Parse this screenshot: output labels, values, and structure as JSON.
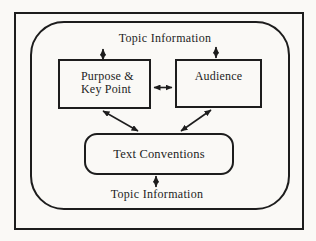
{
  "diagram": {
    "top_label": "Topic Information",
    "bottom_label": "Topic Information",
    "boxes": {
      "purpose_line1": "Purpose &",
      "purpose_line2": "Key Point",
      "audience": "Audience",
      "conventions": "Text Conventions"
    },
    "arrows": [
      "purpose-to-topic-info-top",
      "audience-to-topic-info-top",
      "purpose-audience-bidirectional",
      "purpose-conventions-bidirectional",
      "audience-conventions-bidirectional",
      "conventions-to-topic-info-bottom"
    ],
    "colors": {
      "ink": "#1d1d1d",
      "background": "#faf9f6"
    }
  }
}
